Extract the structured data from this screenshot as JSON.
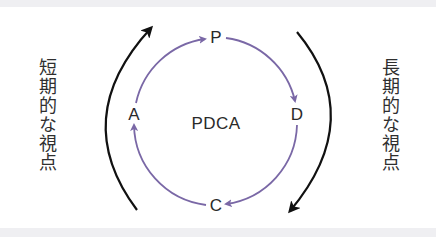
{
  "diagram": {
    "center_label": "PDCA",
    "nodes": [
      {
        "key": "P",
        "label": "P"
      },
      {
        "key": "D",
        "label": "D"
      },
      {
        "key": "C",
        "label": "C"
      },
      {
        "key": "A",
        "label": "A"
      }
    ],
    "left_text": "短期的な視点",
    "right_text": "長期的な視点",
    "colors": {
      "cycle_arrow": "#7a68a6",
      "outer_arrow": "#111111",
      "text": "#2a2a2a",
      "strip": "#efeff2"
    }
  }
}
